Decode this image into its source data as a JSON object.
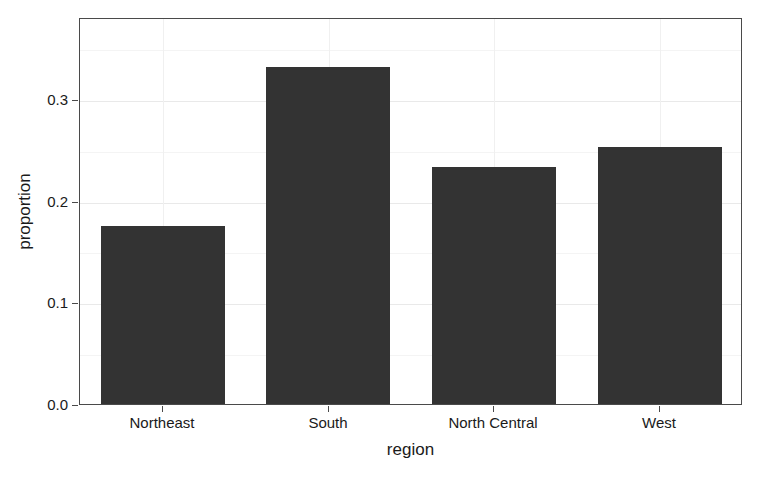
{
  "chart_data": {
    "type": "bar",
    "title": "",
    "subtitle": "",
    "xlabel": "region",
    "ylabel": "proportion",
    "categories": [
      "Northeast",
      "South",
      "North Central",
      "West"
    ],
    "values": [
      0.177,
      0.333,
      0.235,
      0.255
    ],
    "series": [
      {
        "name": "proportion",
        "values": [
          0.177,
          0.333,
          0.235,
          0.255
        ]
      }
    ],
    "ylim": [
      0.0,
      0.3806
    ],
    "y_ticks": [
      0.0,
      0.1,
      0.2,
      0.3
    ],
    "y_tick_labels": [
      "0.0",
      "0.1",
      "0.2",
      "0.3"
    ],
    "y_minor_ticks": [
      0.05,
      0.15,
      0.25,
      0.35
    ],
    "x_tick_labels": [
      "Northeast",
      "South",
      "North Central",
      "West"
    ],
    "grid": true,
    "legend": false,
    "legend_position": "none",
    "bar_color": "#333333",
    "panel_border_color": "#4a4a4a",
    "grid_color_major": "#e9e9e9",
    "grid_color_minor": "#f4f4f4",
    "background": "#ffffff"
  },
  "axis": {
    "y_title": "proportion",
    "x_title": "region"
  }
}
